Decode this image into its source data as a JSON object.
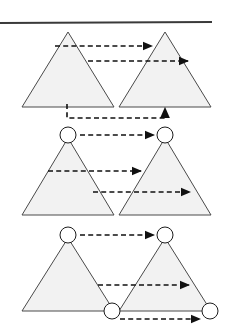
{
  "figure": {
    "canvas": {
      "width": 228,
      "height": 332,
      "background": "#ffffff"
    },
    "colors": {
      "triangle_fill": "#f2f2f2",
      "triangle_stroke": "#4a4a4a",
      "arrow": "#111111",
      "rule": "#3a3a3a",
      "node_fill": "#ffffff",
      "node_stroke": "#1c1c1c"
    },
    "top_rule": {
      "x1": 0,
      "y1": 23,
      "x2": 212,
      "y2": 22,
      "width": 2
    },
    "panels": [
      {
        "id": "panel-1",
        "name": "top-panel",
        "triangles": [
          {
            "id": "p1-left-triangle",
            "apex": [
              68,
              32
            ],
            "base_left": [
              22,
              107
            ],
            "base_right": [
              114,
              107
            ]
          },
          {
            "id": "p1-right-triangle",
            "apex": [
              165,
              32
            ],
            "base_left": [
              119,
              107
            ],
            "base_right": [
              211,
              107
            ]
          }
        ],
        "nodes": [],
        "arrows": [
          {
            "id": "p1-arrow-1",
            "kind": "straight",
            "from": [
              55,
              46
            ],
            "to": [
              155,
              46
            ]
          },
          {
            "id": "p1-arrow-2",
            "kind": "straight",
            "from": [
              88,
              61
            ],
            "to": [
              191,
              61
            ]
          },
          {
            "id": "p1-arrow-3",
            "kind": "elbow-up",
            "from": [
              67,
              104
            ],
            "corner": [
              67,
              118
            ],
            "elbow_x": 165,
            "to": [
              165,
              105
            ]
          }
        ]
      },
      {
        "id": "panel-2",
        "name": "middle-panel",
        "triangles": [
          {
            "id": "p2-left-triangle",
            "apex": [
              68,
              138
            ],
            "base_left": [
              22,
              215
            ],
            "base_right": [
              114,
              215
            ]
          },
          {
            "id": "p2-right-triangle",
            "apex": [
              165,
              138
            ],
            "base_left": [
              119,
              215
            ],
            "base_right": [
              211,
              215
            ]
          }
        ],
        "nodes": [
          {
            "id": "p2-left-apex-node",
            "center": [
              68,
              135
            ],
            "r": 8
          },
          {
            "id": "p2-right-apex-node",
            "center": [
              165,
              135
            ],
            "r": 8
          }
        ],
        "arrows": [
          {
            "id": "p2-arrow-1",
            "kind": "straight",
            "from": [
              80,
              135
            ],
            "to": [
              157,
              135
            ]
          },
          {
            "id": "p2-arrow-2",
            "kind": "straight",
            "from": [
              48,
              171
            ],
            "to": [
              144,
              171
            ]
          },
          {
            "id": "p2-arrow-3",
            "kind": "straight",
            "from": [
              93,
              192
            ],
            "to": [
              193,
              192
            ]
          }
        ]
      },
      {
        "id": "panel-3",
        "name": "bottom-panel",
        "triangles": [
          {
            "id": "p3-left-triangle",
            "apex": [
              68,
              238
            ],
            "base_left": [
              22,
              311
            ],
            "base_right": [
              114,
              311
            ]
          },
          {
            "id": "p3-right-triangle",
            "apex": [
              165,
              238
            ],
            "base_left": [
              119,
              311
            ],
            "base_right": [
              211,
              311
            ]
          }
        ],
        "nodes": [
          {
            "id": "p3-left-apex-node",
            "center": [
              68,
              235
            ],
            "r": 8
          },
          {
            "id": "p3-right-apex-node",
            "center": [
              165,
              235
            ],
            "r": 8
          },
          {
            "id": "p3-left-base-node",
            "center": [
              112,
              311
            ],
            "r": 8
          },
          {
            "id": "p3-right-base-node",
            "center": [
              210,
              311
            ],
            "r": 8
          }
        ],
        "arrows": [
          {
            "id": "p3-arrow-1",
            "kind": "straight",
            "from": [
              80,
              235
            ],
            "to": [
              157,
              235
            ]
          },
          {
            "id": "p3-arrow-2",
            "kind": "straight",
            "from": [
              98,
              285
            ],
            "to": [
              192,
              285
            ]
          },
          {
            "id": "p3-arrow-3",
            "kind": "straight",
            "from": [
              120,
              319
            ],
            "to": [
              203,
              319
            ]
          }
        ]
      }
    ]
  }
}
